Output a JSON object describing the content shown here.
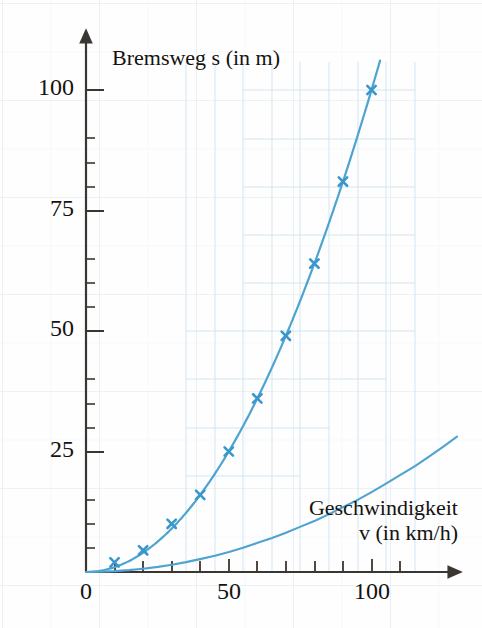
{
  "chart_data": {
    "type": "line",
    "title": "",
    "subtitle": "",
    "xlabel_lines": [
      "Geschwindigkeit",
      "v (in km/h)"
    ],
    "xlabel": "Geschwindigkeit v (in km/h)",
    "ylabel": "Bremsweg s (in m)",
    "xlim": [
      0,
      110
    ],
    "ylim": [
      0,
      110
    ],
    "xticks_major": [
      0,
      50,
      100
    ],
    "xtick_labels": [
      "0",
      "50",
      "100"
    ],
    "xticks_minor": [
      10,
      20,
      30,
      40,
      60,
      70,
      80,
      90,
      110
    ],
    "yticks_major": [
      0,
      25,
      50,
      75,
      100
    ],
    "ytick_labels": [
      "0",
      "25",
      "50",
      "75",
      "100"
    ],
    "grid": true,
    "grid_style": "faint graph paper background",
    "legend": "none",
    "marker": "x",
    "series": [
      {
        "name": "Bremsweg",
        "color": "#4fa3d1",
        "x": [
          10,
          20,
          30,
          40,
          50,
          60,
          70,
          80,
          90,
          100
        ],
        "y": [
          2,
          4.5,
          10,
          16,
          25,
          36,
          49,
          64,
          81,
          100
        ]
      }
    ],
    "curve_formula": "s = v^2 / 100",
    "curve_x_range": [
      0,
      103
    ],
    "annotations": []
  },
  "axis": {
    "x_arrow": true,
    "y_arrow": true,
    "axis_color": "#3a3632",
    "origin_label": "0"
  },
  "colors": {
    "curve": "#4fa3d1",
    "marker": "#3a97cd",
    "axis": "#3a3632",
    "text": "#15120f",
    "grid": "#e4ecef",
    "background": "#fefefe"
  }
}
